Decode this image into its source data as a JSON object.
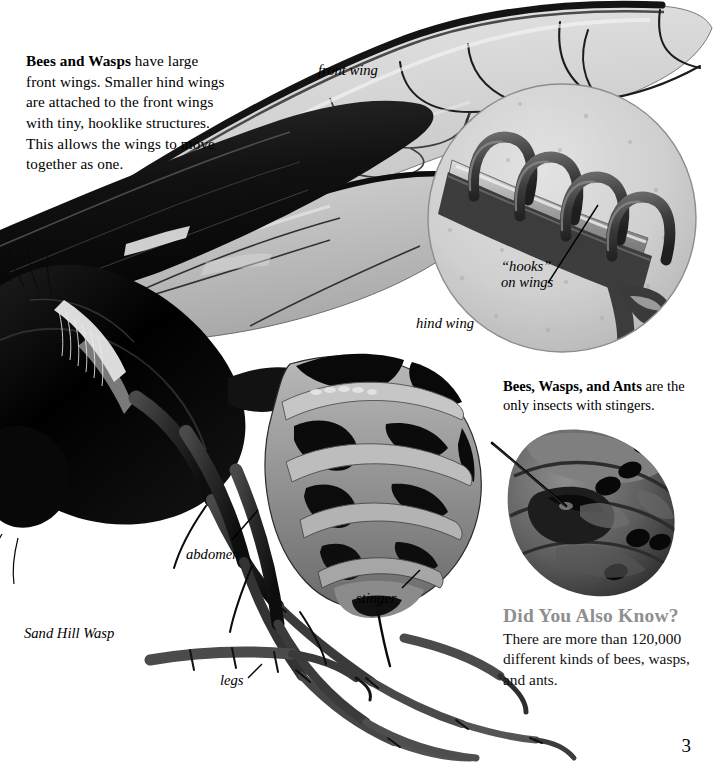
{
  "page": {
    "number": "3",
    "background_color": "#ffffff",
    "ink_color": "#000000",
    "accent_gray": "#8f8f8f"
  },
  "intro": {
    "lead": "Bees and Wasps",
    "body": " have large front wings. Smaller hind wings are attached to the front wings with tiny, hooklike structures. This allows the wings to move together as one."
  },
  "stinger_note": {
    "lead": "Bees, Wasps, and Ants",
    "body": " are the only insects with stingers."
  },
  "did_you_also_know": {
    "title": "Did You Also Know?",
    "body": "There are more than 120,000 different kinds of bees, wasps, and ants."
  },
  "labels": {
    "front_wing": "front wing",
    "hind_wing": "hind wing",
    "hooks_line1": "“hooks”",
    "hooks_line2": "on wings",
    "abdomen": "abdomen",
    "stinger": "stinger",
    "legs": "legs",
    "species": "Sand Hill Wasp"
  },
  "illustration": {
    "subject": "sand-hill-wasp-lateral-view",
    "insets": [
      {
        "name": "wing-hooks-magnifier",
        "shape": "circle"
      },
      {
        "name": "abdomen-stinger-closeup",
        "shape": "oval"
      }
    ]
  }
}
